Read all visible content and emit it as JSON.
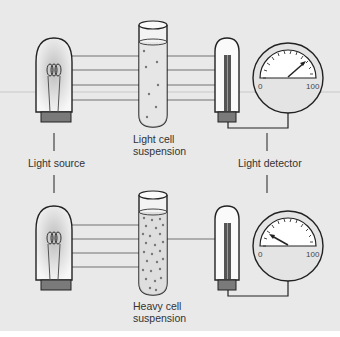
{
  "diagram": {
    "labels": {
      "light_source": "Light source",
      "light_detector": "Light detector",
      "light_suspension": [
        "Light cell",
        "suspension"
      ],
      "heavy_suspension": [
        "Heavy cell",
        "suspension"
      ]
    },
    "meter": {
      "min_label": "0",
      "max_label": "100"
    },
    "setups": [
      {
        "name": "light-cell",
        "beams_in": 4,
        "beams_out": 4,
        "reading_approx": 75
      },
      {
        "name": "heavy-cell",
        "beams_in": 4,
        "beams_out": 1,
        "reading_approx": 20
      }
    ],
    "colors": {
      "background": "#e9e9e9",
      "line": "#222222",
      "beam": "#9a9a9a",
      "base": "#7a7a7a"
    }
  }
}
